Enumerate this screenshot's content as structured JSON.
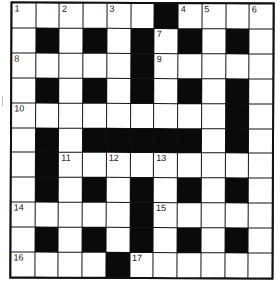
{
  "puzzle": {
    "rows": 11,
    "cols": 11,
    "colors": {
      "block": "#0a0a0a",
      "cell": "#ffffff",
      "line": "#111111"
    },
    "grid": [
      "...#.#.#...",
      ".#.#.#.#.#.",
      "...........",
      ".#.#.#.#.#.",
      ".........#.",
      ".#.#####.#.",
      ".#.........",
      ".#.#.#.#.#.",
      ".....#.....",
      ".#.#.#.#.#.",
      "....#......"
    ],
    "layout": [
      "......#....",
      ".#.#.#.#.#.",
      ".....#.....",
      ".#.#.#.#.#.",
      ".........#.",
      ".#.#####.#.",
      ".#.........",
      ".#.#.#.#.#.",
      ".....#.....",
      ".#.#.#.#.#.",
      "....#......"
    ],
    "numbers": [
      {
        "n": "1",
        "r": 0,
        "c": 0
      },
      {
        "n": "2",
        "r": 0,
        "c": 2
      },
      {
        "n": "3",
        "r": 0,
        "c": 4
      },
      {
        "n": "4",
        "r": 0,
        "c": 7
      },
      {
        "n": "5",
        "r": 0,
        "c": 8
      },
      {
        "n": "6",
        "r": 0,
        "c": 10
      },
      {
        "n": "7",
        "r": 1,
        "c": 6
      },
      {
        "n": "8",
        "r": 2,
        "c": 0
      },
      {
        "n": "9",
        "r": 2,
        "c": 6
      },
      {
        "n": "10",
        "r": 4,
        "c": 0
      },
      {
        "n": "11",
        "r": 6,
        "c": 2
      },
      {
        "n": "12",
        "r": 6,
        "c": 4
      },
      {
        "n": "13",
        "r": 6,
        "c": 6
      },
      {
        "n": "14",
        "r": 8,
        "c": 0
      },
      {
        "n": "15",
        "r": 8,
        "c": 6
      },
      {
        "n": "16",
        "r": 10,
        "c": 0
      },
      {
        "n": "17",
        "r": 10,
        "c": 5
      }
    ]
  }
}
